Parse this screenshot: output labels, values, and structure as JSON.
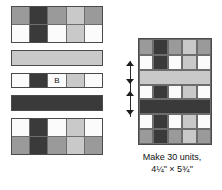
{
  "figure": {
    "type": "quilt-block-assembly-diagram",
    "caption_line1": "Make 30 units,",
    "caption_line2": "4¼\" × 5¾\"",
    "label_b": "B"
  },
  "colors": {
    "white": "#fbfbfb",
    "light_gray": "#c9c9c9",
    "medium_gray": "#9a9a9a",
    "dark_gray": "#3a3a3a",
    "outline": "#4a4a4a",
    "cell_outline": "#6d6d6d",
    "text": "#111111",
    "background": "#ffffff"
  },
  "left_column": {
    "name": "exploded-pieces",
    "pieces": [
      {
        "id": "piece-top",
        "name": "four-patch-unit-top",
        "kind": "grid",
        "columns": [
          {
            "width": 18,
            "top": "medium_gray",
            "bottom": "white"
          },
          {
            "width": 18,
            "top": "dark_gray",
            "bottom": "dark_gray"
          },
          {
            "width": 18,
            "top": "medium_gray",
            "bottom": "white"
          },
          {
            "width": 18,
            "top": "light_gray",
            "bottom": "light_gray"
          },
          {
            "width": 18,
            "top": "medium_gray",
            "bottom": "white"
          }
        ]
      },
      {
        "id": "piece-light-strip",
        "name": "light-gray-sashing-strip",
        "kind": "solid",
        "color": "light_gray"
      },
      {
        "id": "piece-b-strip",
        "name": "pieced-strip-b",
        "kind": "strip",
        "columns": [
          {
            "width": 18,
            "color": "white"
          },
          {
            "width": 18,
            "color": "dark_gray"
          },
          {
            "width": 18,
            "color": "white",
            "label": "B"
          },
          {
            "width": 18,
            "color": "light_gray"
          },
          {
            "width": 18,
            "color": "white"
          }
        ]
      },
      {
        "id": "piece-dark-strip",
        "name": "dark-gray-sashing-strip",
        "kind": "solid",
        "color": "dark_gray"
      },
      {
        "id": "piece-bottom",
        "name": "four-patch-unit-bottom",
        "kind": "grid",
        "columns": [
          {
            "width": 18,
            "top": "white",
            "bottom": "medium_gray"
          },
          {
            "width": 18,
            "top": "dark_gray",
            "bottom": "dark_gray"
          },
          {
            "width": 18,
            "top": "white",
            "bottom": "medium_gray"
          },
          {
            "width": 18,
            "top": "light_gray",
            "bottom": "light_gray"
          },
          {
            "width": 18,
            "top": "white",
            "bottom": "medium_gray"
          }
        ]
      }
    ]
  },
  "right_block": {
    "name": "assembled-block",
    "columns": [
      18,
      18,
      18,
      18,
      18
    ],
    "rows": [
      {
        "name": "row-1",
        "kind": "cells",
        "height": 18,
        "cells": [
          "medium_gray",
          "dark_gray",
          "medium_gray",
          "light_gray",
          "medium_gray"
        ]
      },
      {
        "name": "row-2",
        "kind": "cells",
        "height": 18,
        "cells": [
          "white",
          "dark_gray",
          "white",
          "light_gray",
          "white"
        ]
      },
      {
        "name": "row-3",
        "kind": "strip",
        "height": 15,
        "color": "light_gray"
      },
      {
        "name": "row-4",
        "kind": "cells",
        "height": 16,
        "cells": [
          "white",
          "dark_gray",
          "white",
          "light_gray",
          "white"
        ]
      },
      {
        "name": "row-5",
        "kind": "strip",
        "height": 15,
        "color": "dark_gray"
      },
      {
        "name": "row-6",
        "kind": "cells",
        "height": 17,
        "cells": [
          "white",
          "dark_gray",
          "white",
          "light_gray",
          "white"
        ]
      },
      {
        "name": "row-7",
        "kind": "cells",
        "height": 17,
        "cells": [
          "medium_gray",
          "dark_gray",
          "medium_gray",
          "light_gray",
          "medium_gray"
        ]
      }
    ]
  },
  "dimension_marks": {
    "name": "height-dimension-arrows",
    "count": 4
  }
}
